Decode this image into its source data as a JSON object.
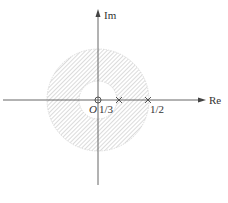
{
  "diagram": {
    "type": "z-plane pole-zero plot with region of convergence",
    "axes": {
      "real_label": "Re",
      "imag_label": "Im",
      "origin_label": "O"
    },
    "region_of_convergence": {
      "shape": "annulus",
      "inner_radius": "1/3",
      "outer_radius": "1/2",
      "fill": "hatched"
    },
    "zeros": [
      {
        "position": "0",
        "symbol": "o"
      }
    ],
    "poles": [
      {
        "position": "1/3",
        "label": "1/3",
        "symbol": "x"
      },
      {
        "position": "1/2",
        "label": "1/2",
        "symbol": "x"
      }
    ],
    "colors": {
      "axis": "#555555",
      "hatch": "#b8b8b8",
      "text": "#333333"
    }
  }
}
